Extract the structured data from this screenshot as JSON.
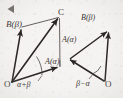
{
  "figure": {
    "background_color": "#f4f3f1",
    "ink_color": "#2b2724",
    "cursor_marker": {
      "name": "play-triangle-marker",
      "direction": "left",
      "color": "#6e6a66"
    },
    "left_diagram": {
      "name": "parallelogram-alpha-plus-beta",
      "type": "parallelogram",
      "vertices": {
        "O": {
          "label": "O",
          "x": 11,
          "y": 83
        },
        "A": {
          "label": "A(α)",
          "x": 62,
          "y": 66
        },
        "B": {
          "label": "B(β)",
          "x": 22,
          "y": 27
        },
        "C": {
          "label": "C",
          "x": 60,
          "y": 16
        }
      },
      "labels": {
        "O": "O",
        "A": "A(α)",
        "B": "B(β)",
        "C": "C",
        "angle": "α+β"
      },
      "vectors": [
        {
          "name": "vector-OA",
          "from": "O",
          "to": "A",
          "arrow": true
        },
        {
          "name": "vector-OB",
          "from": "O",
          "to": "B",
          "arrow": true
        },
        {
          "name": "vector-OC",
          "from": "O",
          "to": "C",
          "arrow": true
        },
        {
          "name": "edge-BC",
          "from": "B",
          "to": "C",
          "arrow": false
        },
        {
          "name": "edge-AC",
          "from": "A",
          "to": "C",
          "arrow": false
        }
      ],
      "angle_arc": {
        "name": "angle-alpha-plus-beta",
        "label": "α+β"
      }
    },
    "right_diagram": {
      "name": "triangle-beta-minus-alpha",
      "type": "triangle",
      "vertices": {
        "O": {
          "label": "O",
          "x": 106,
          "y": 84
        },
        "A": {
          "label": "A(α)",
          "x": 70,
          "y": 58
        },
        "B": {
          "label": "B(β)",
          "x": 110,
          "y": 28
        }
      },
      "labels": {
        "O": "O",
        "A": "A(α)",
        "B": "B(β)",
        "angle": "β−α"
      },
      "vectors": [
        {
          "name": "vector-OA",
          "from": "O",
          "to": "A",
          "arrow": true
        },
        {
          "name": "vector-OB",
          "from": "O",
          "to": "B",
          "arrow": true
        },
        {
          "name": "vector-AB",
          "from": "A",
          "to": "B",
          "arrow": true
        }
      ],
      "angle_arc": {
        "name": "angle-beta-minus-alpha",
        "label": "β−α"
      }
    }
  }
}
